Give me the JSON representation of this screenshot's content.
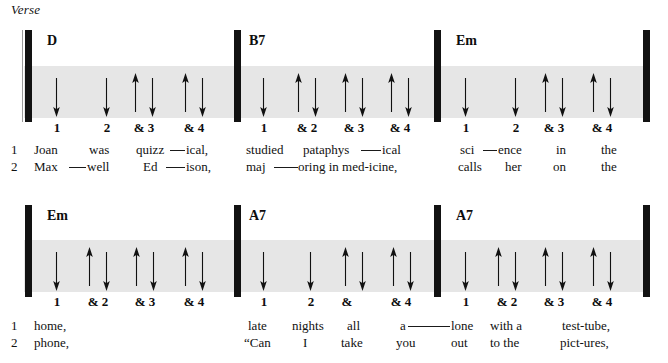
{
  "section": {
    "label": "Verse"
  },
  "systems": [
    {
      "name": "system-1",
      "measures": [
        {
          "chord": "D",
          "beats": [
            "1",
            "2",
            "& 3",
            "& 4"
          ],
          "strums": [
            "down",
            "down",
            "up",
            "down",
            "up",
            "down"
          ],
          "lyric_rows": [
            {
              "number": "1",
              "words": [
                "Joan",
                "was",
                "quizz",
                "ical,"
              ]
            },
            {
              "number": "2",
              "words": [
                "Max",
                "well",
                "Ed",
                "ison,"
              ]
            }
          ]
        },
        {
          "chord": "B7",
          "beats": [
            "1",
            "& 2",
            "& 3",
            "& 4"
          ],
          "strums": [
            "down",
            "up",
            "down",
            "up",
            "down",
            "up",
            "down"
          ],
          "lyric_rows": [
            {
              "number": "",
              "words": [
                "studied",
                "pataphys",
                "ical"
              ]
            },
            {
              "number": "",
              "words": [
                "maj",
                "oring in med-icine,"
              ]
            }
          ]
        },
        {
          "chord": "Em",
          "beats": [
            "1",
            "2",
            "& 3",
            "& 4"
          ],
          "strums": [
            "down",
            "down",
            "up",
            "down",
            "up",
            "down"
          ],
          "lyric_rows": [
            {
              "number": "",
              "words": [
                "sci",
                "ence",
                "in",
                "the"
              ]
            },
            {
              "number": "",
              "words": [
                "calls",
                "her",
                "on",
                "the"
              ]
            }
          ]
        }
      ]
    },
    {
      "name": "system-2",
      "measures": [
        {
          "chord": "Em",
          "beats": [
            "1",
            "& 2",
            "& 3",
            "& 4"
          ],
          "strums": [
            "down",
            "up",
            "down",
            "up",
            "down",
            "up",
            "down"
          ],
          "lyric_rows": [
            {
              "number": "1",
              "words": [
                "home,"
              ]
            },
            {
              "number": "2",
              "words": [
                "phone,"
              ]
            }
          ]
        },
        {
          "chord": "A7",
          "beats": [
            "1",
            "2",
            "&",
            "& 4"
          ],
          "strums": [
            "down",
            "down",
            "up",
            "down",
            "up",
            "down"
          ],
          "lyric_rows": [
            {
              "number": "",
              "words": [
                "late",
                "nights",
                "all",
                "a"
              ]
            },
            {
              "number": "",
              "words": [
                "“Can",
                "I",
                "take",
                "you"
              ]
            }
          ]
        },
        {
          "chord": "A7",
          "beats": [
            "1",
            "& 2",
            "& 3",
            "& 4"
          ],
          "strums": [
            "down",
            "up",
            "down",
            "up",
            "down",
            "up",
            "down"
          ],
          "lyric_rows": [
            {
              "number": "",
              "words": [
                "lone",
                "with a",
                "test-tube,"
              ]
            },
            {
              "number": "",
              "words": [
                "out",
                "to the",
                "pict-ures,"
              ]
            }
          ]
        }
      ]
    }
  ],
  "s1": {
    "chord1": "D",
    "chord2": "B7",
    "chord3": "Em",
    "m1b1": "1",
    "m1b2": "2",
    "m1b3": "& 3",
    "m1b4": "& 4",
    "m2b1": "1",
    "m2b2": "& 2",
    "m2b3": "& 3",
    "m2b4": "& 4",
    "m3b1": "1",
    "m3b2": "2",
    "m3b3": "& 3",
    "m3b4": "& 4",
    "row1num": "1",
    "row2num": "2",
    "l1a": "Joan",
    "l1b": "was",
    "l1c": "quizz",
    "l1d": "ical,",
    "l1e": "studied",
    "l1f": "pataphys",
    "l1g": "ical",
    "l1h": "sci",
    "l1i": "ence",
    "l1j": "in",
    "l1k": "the",
    "l2a": "Max",
    "l2b": "well",
    "l2c": "Ed",
    "l2d": "ison,",
    "l2e": "maj",
    "l2f": "oring in med-icine,",
    "l2h": "calls",
    "l2i": "her",
    "l2j": "on",
    "l2k": "the"
  },
  "s2": {
    "chord1": "Em",
    "chord2": "A7",
    "chord3": "A7",
    "m1b1": "1",
    "m1b2": "& 2",
    "m1b3": "& 3",
    "m1b4": "& 4",
    "m2b1": "1",
    "m2b2": "2",
    "m2b3": "&",
    "m2b4": "& 4",
    "m3b1": "1",
    "m3b2": "& 2",
    "m3b3": "& 3",
    "m3b4": "& 4",
    "row1num": "1",
    "row2num": "2",
    "l1a": "home,",
    "l1e": "late",
    "l1f": "nights",
    "l1g": "all",
    "l1h": "a",
    "l1i": "lone",
    "l1j": "with a",
    "l1k": "test-tube,",
    "l2a": "phone,",
    "l2e": "“Can",
    "l2f": "I",
    "l2g": "take",
    "l2h": "you",
    "l2i": "out",
    "l2j": "to the",
    "l2k": "pict-ures,"
  },
  "colors": {
    "band": "#e6e6e6",
    "ink": "#111111",
    "barline": "#121212"
  }
}
